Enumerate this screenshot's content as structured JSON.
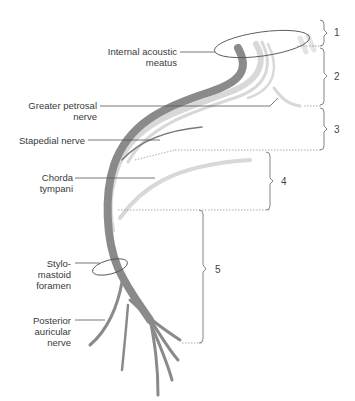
{
  "figure": {
    "labels": [
      {
        "id": "internal-acoustic-meatus",
        "text": "Internal acoustic\nmeatus"
      },
      {
        "id": "greater-petrosal-nerve",
        "text": "Greater petrosal\nnerve"
      },
      {
        "id": "stapedial-nerve",
        "text": "Stapedial nerve"
      },
      {
        "id": "chorda-tympani",
        "text": "Chorda\ntympani"
      },
      {
        "id": "stylomastoid-foramen",
        "text": "Stylo-\nmastoid\nforamen"
      },
      {
        "id": "posterior-auricular-nerve",
        "text": "Posterior\nauricular\nnerve"
      }
    ],
    "segments": [
      "1",
      "2",
      "3",
      "4",
      "5"
    ],
    "colors": {
      "trunk": "#8a8a8a",
      "light_fibers": "#d4d4d4",
      "leader_line": "#555555",
      "bracket": "#777777"
    }
  }
}
